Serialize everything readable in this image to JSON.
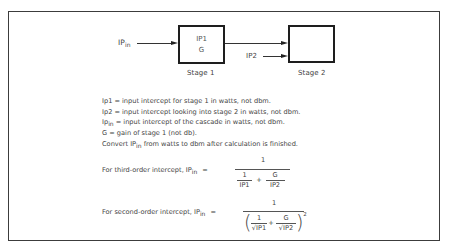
{
  "diagram": {
    "input_label": "IP",
    "input_label_sub": "in",
    "stage1": {
      "line1": "IP1",
      "line2": "G",
      "caption": "Stage 1"
    },
    "stage2": {
      "caption": "Stage 2"
    },
    "ip2_label": "IP2"
  },
  "definitions": [
    {
      "text": "Ip1 = input intercept for stage 1 in watts, not dbm."
    },
    {
      "text": "Ip2 = input intercept looking into stage 2 in watts, not dbm."
    },
    {
      "prefix": "Ip",
      "sub": "in",
      "text": " = input intercept of the cascade in watts, not dbm."
    },
    {
      "text": "G = gain of stage 1 (not db)."
    },
    {
      "prefix": "Convert IP",
      "sub": "in",
      "text": " from watts to dbm after calculation is finished."
    }
  ],
  "formula_third": {
    "lead": "For third-order intercept, IP",
    "lead_sub": "in",
    "equals": "=",
    "numerator": "1",
    "term1_num": "1",
    "term1_den": "IP1",
    "plus": "+",
    "term2_num": "G",
    "term2_den": "IP2"
  },
  "formula_second": {
    "lead": "For second-order intercept, IP",
    "lead_sub": "in",
    "equals": "=",
    "numerator": "1",
    "term1_num": "1",
    "term1_den": "√IP1",
    "plus": "+",
    "term2_num": "G",
    "term2_den": "√IP2",
    "lparen": "(",
    "rparen": ")",
    "exponent": "2"
  }
}
